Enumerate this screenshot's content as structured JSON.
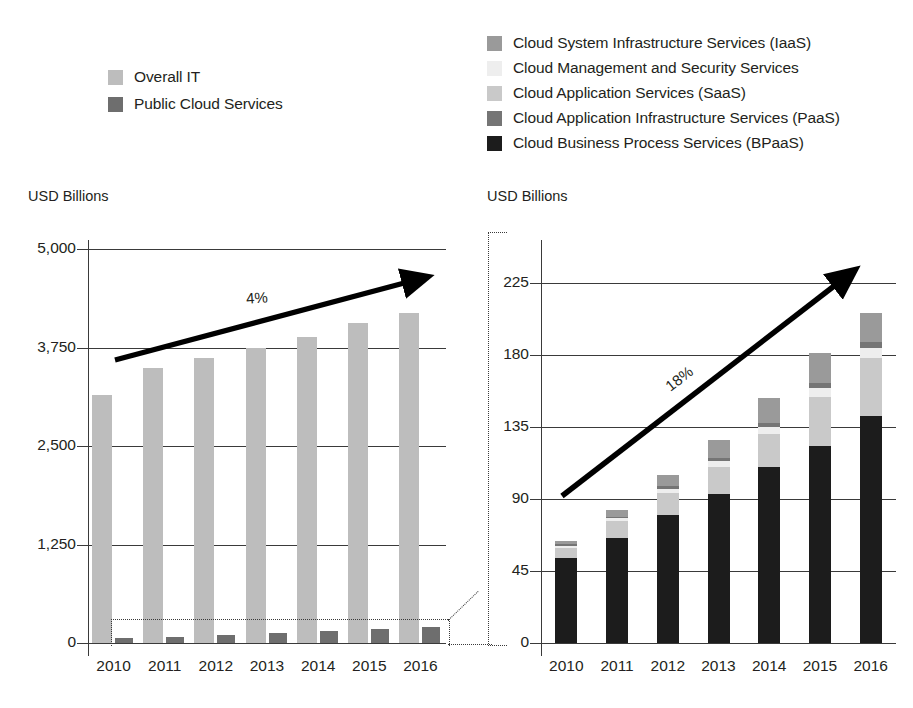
{
  "legends": {
    "left": {
      "items": [
        {
          "label": "Overall IT",
          "color": "#bdbdbd"
        },
        {
          "label": "Public Cloud Services",
          "color": "#6e6e6e"
        }
      ]
    },
    "right": {
      "items": [
        {
          "label": "Cloud System Infrastructure Services (IaaS)",
          "color": "#9a9a9a"
        },
        {
          "label": "Cloud Management and Security Services",
          "color": "#eeeeee"
        },
        {
          "label": "Cloud Application Services (SaaS)",
          "color": "#c9c9c9"
        },
        {
          "label": "Cloud Application Infrastructure Services (PaaS)",
          "color": "#757575"
        },
        {
          "label": "Cloud Business Process Services (BPaaS)",
          "color": "#1c1c1c"
        }
      ]
    }
  },
  "chart_data": [
    {
      "id": "overall-it-chart",
      "type": "bar",
      "title": "",
      "ylabel": "USD Billions",
      "xlabel": "",
      "ylim": [
        0,
        5000
      ],
      "yticks": [
        0,
        1250,
        2500,
        3750,
        5000
      ],
      "ytick_labels": [
        "0",
        "1,250",
        "2,500",
        "3,750",
        "5,000"
      ],
      "grid": true,
      "legend_position": "above-left",
      "categories": [
        "2010",
        "2011",
        "2012",
        "2013",
        "2014",
        "2015",
        "2016"
      ],
      "series": [
        {
          "name": "Overall IT",
          "color": "#bdbdbd",
          "values": [
            3150,
            3490,
            3620,
            3750,
            3880,
            4060,
            4190
          ]
        },
        {
          "name": "Public Cloud Services",
          "color": "#6e6e6e",
          "values": [
            60,
            80,
            100,
            130,
            155,
            180,
            205
          ]
        }
      ],
      "annotations": [
        {
          "text": "4%",
          "type": "growth-arrow",
          "from": [
            "2010",
            3600
          ],
          "to": [
            "2016",
            4720
          ]
        }
      ],
      "callout": "dotted box around Public Cloud Services bars, expanded in right chart"
    },
    {
      "id": "public-cloud-breakdown-chart",
      "type": "bar",
      "stacked": true,
      "title": "",
      "ylabel": "USD Billions",
      "xlabel": "",
      "ylim": [
        0,
        248
      ],
      "yticks": [
        0,
        45,
        90,
        135,
        180,
        225
      ],
      "ytick_labels": [
        "0",
        "45",
        "90",
        "135",
        "180",
        "225"
      ],
      "grid": true,
      "legend_position": "above",
      "categories": [
        "2010",
        "2011",
        "2012",
        "2013",
        "2014",
        "2015",
        "2016"
      ],
      "series": [
        {
          "name": "Cloud Business Process Services (BPaaS)",
          "color": "#1c1c1c",
          "values": [
            53.0,
            65.5,
            80.0,
            93.0,
            110.0,
            123.0,
            142.0
          ]
        },
        {
          "name": "Cloud Application Services (SaaS)",
          "color": "#c9c9c9",
          "values": [
            6.5,
            10.5,
            14.0,
            17.0,
            20.5,
            31.0,
            36.0
          ]
        },
        {
          "name": "Cloud Management and Security Services",
          "color": "#eeeeee",
          "values": [
            1.5,
            2.0,
            2.5,
            3.5,
            4.5,
            5.5,
            6.5
          ]
        },
        {
          "name": "Cloud Application Infrastructure Services (PaaS)",
          "color": "#757575",
          "values": [
            0.8,
            1.0,
            1.5,
            2.0,
            2.5,
            3.0,
            3.5
          ]
        },
        {
          "name": "Cloud System Infrastructure Services (IaaS)",
          "color": "#9a9a9a",
          "values": [
            2.2,
            4.0,
            7.0,
            11.5,
            15.5,
            18.5,
            18.0
          ]
        }
      ],
      "totals": [
        64,
        83,
        105,
        127,
        153,
        181,
        206
      ],
      "annotations": [
        {
          "text": "18%",
          "type": "growth-arrow",
          "from": [
            "2010",
            91
          ],
          "to": [
            "2016",
            232
          ]
        }
      ]
    }
  ]
}
